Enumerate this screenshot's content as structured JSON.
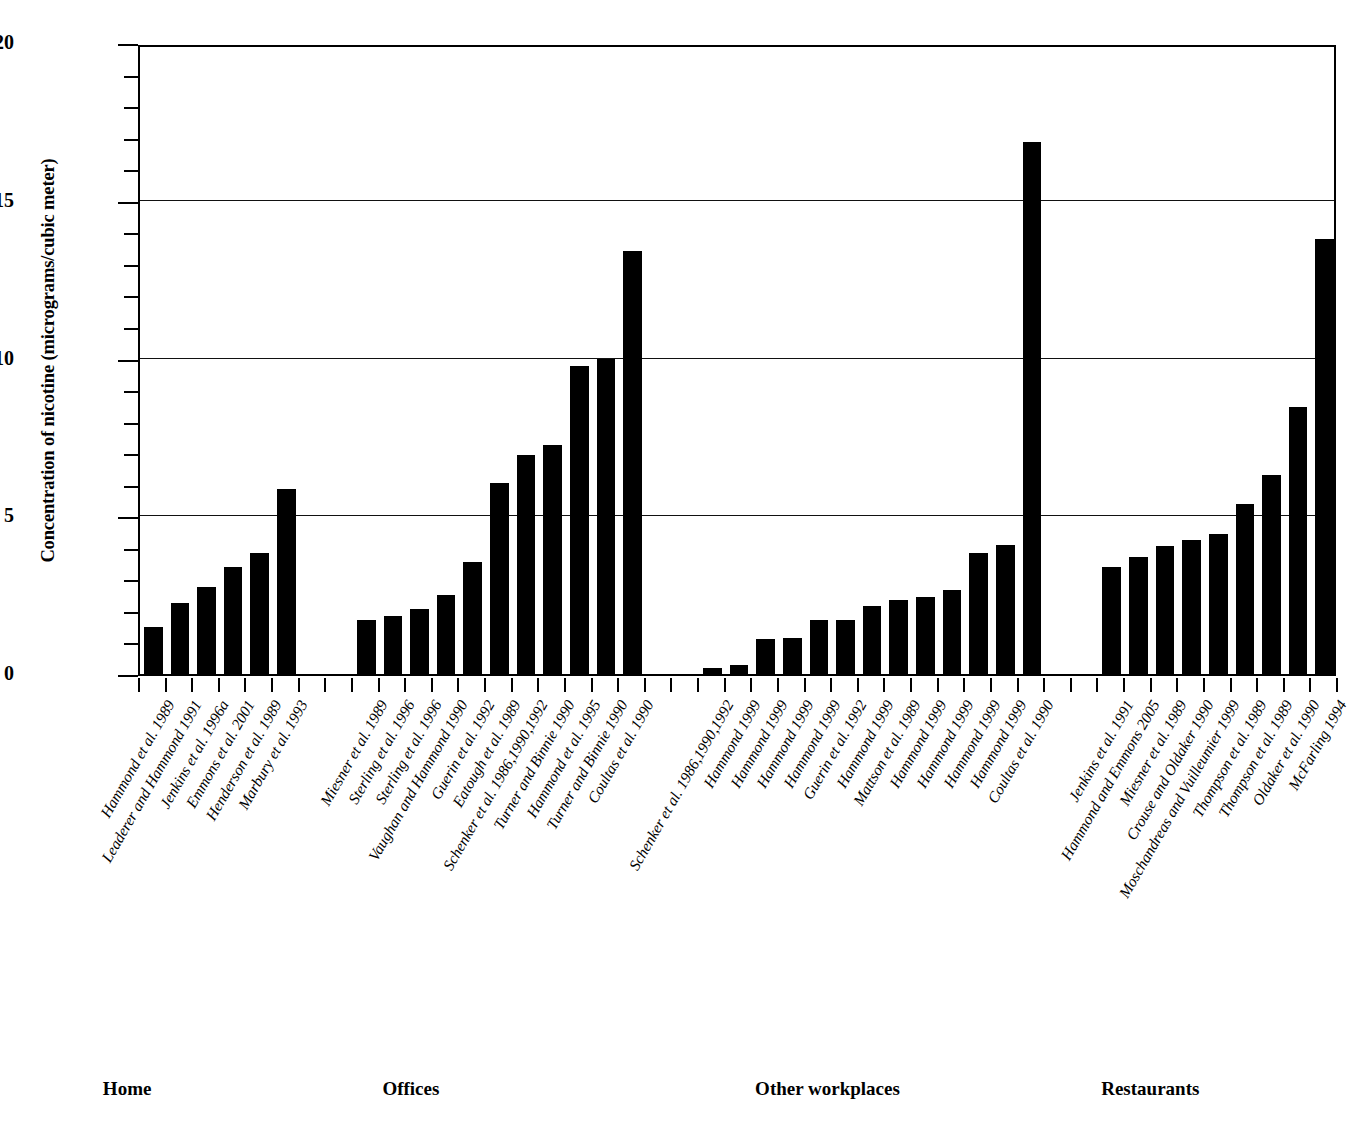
{
  "chart_data": {
    "type": "bar",
    "title": "",
    "xlabel": "",
    "ylabel": "Concentration of nicotine (micrograms/cubic meter)",
    "ylim": [
      0,
      20
    ],
    "ytick_labels": [
      "0",
      "5",
      "10",
      "15",
      "20"
    ],
    "ytick_values": [
      0,
      5,
      10,
      15,
      20
    ],
    "yminor_step": 1,
    "grid": true,
    "grid_axis": "y",
    "legend": "none",
    "bar_color": "#000000",
    "groups": [
      {
        "name": "Home",
        "categories": [
          "Hammond et al. 1989",
          "Leaderer and Hammond 1991",
          "Jenkins et al. 1996a",
          "Emmons  et al. 2001",
          "Henderson et al. 1989",
          "Marbury et al. 1993"
        ],
        "values": [
          1.5,
          2.25,
          2.75,
          3.4,
          3.85,
          5.85
        ]
      },
      {
        "name": "Offices",
        "categories": [
          "Miesner et al. 1989",
          "Sterling et al. 1996",
          "Sterling et al. 1996",
          "Vaughan and Hammond 1990",
          "Guerin et al. 1992",
          "Eatough et al. 1989",
          "Schenker et al. 1986,1990,1992",
          "Turner and Binnie 1990",
          "Hammond et al. 1995",
          "Turner and Binnie 1990",
          "Coultas et al. 1990"
        ],
        "values": [
          1.7,
          1.85,
          2.05,
          2.5,
          3.55,
          6.05,
          6.95,
          7.25,
          9.75,
          10.0,
          13.4
        ]
      },
      {
        "name": "Other workplaces",
        "categories": [
          "Schenker et al. 1986,1990,1992",
          "Hammond 1999",
          "Hammond 1999",
          "Hammond 1999",
          "Hammond 1999",
          "Guerin  et al. 1992",
          "Hammond 1999",
          "Mattson et al. 1989",
          "Hammond 1999",
          "Hammond 1999",
          "Hammond 1999",
          "Hammond 1999",
          "Coultas et al. 1990"
        ],
        "values": [
          0.2,
          0.3,
          1.1,
          1.15,
          1.7,
          1.7,
          2.15,
          2.35,
          2.45,
          2.65,
          3.85,
          4.1,
          16.85
        ]
      },
      {
        "name": "Restaurants",
        "categories": [
          "Jenkins et al. 1991",
          "Hammond and Emmons 2005",
          "Miesner et al. 1989",
          "Crouse and Oldaker 1990",
          "Moschandreas and Vuilleumier 1999",
          "Thompson et al. 1989",
          "Thompson et al. 1989",
          "Oldaker et al. 1990",
          "McFarling 1994"
        ],
        "values": [
          3.4,
          3.7,
          4.05,
          4.25,
          4.45,
          5.4,
          6.3,
          8.45,
          13.8
        ]
      }
    ]
  }
}
